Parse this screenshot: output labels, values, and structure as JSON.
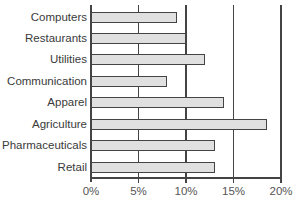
{
  "chart_data": {
    "type": "bar",
    "orientation": "horizontal",
    "title": "",
    "xlabel": "",
    "ylabel": "",
    "categories": [
      "Computers",
      "Restaurants",
      "Utilities",
      "Communication",
      "Apparel",
      "Agriculture",
      "Pharmaceuticals",
      "Retail"
    ],
    "values": [
      9,
      10,
      12,
      8,
      14,
      18.5,
      13,
      13
    ],
    "value_unit": "%",
    "xlim": [
      0,
      20
    ],
    "x_ticks": [
      "0%",
      "5%",
      "10%",
      "15%",
      "20%"
    ],
    "grid": true,
    "legend": null,
    "colors": {
      "bar_fill": "#e0e0e0",
      "bar_border": "#444444",
      "grid": "#444444"
    }
  }
}
